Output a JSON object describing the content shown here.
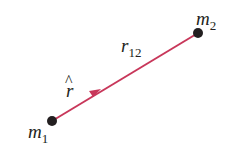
{
  "diagram": {
    "mass1": {
      "label": "m",
      "subscript": "1"
    },
    "mass2": {
      "label": "m",
      "subscript": "2"
    },
    "distance": {
      "label": "r",
      "subscript": "12"
    },
    "unit_vector": {
      "label": "r",
      "hat": "^"
    },
    "colors": {
      "line": "#c8375a",
      "dot": "#231f20",
      "text": "#231f20"
    }
  }
}
